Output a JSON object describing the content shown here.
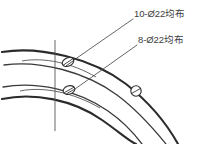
{
  "drawing": {
    "title": "Partial flange hole pattern detail",
    "background_color": "#ffffff",
    "line_color": "#2b2b2b",
    "centerline_color": "#555555",
    "leader_color": "#4a4a4a",
    "annotations": [
      {
        "id": "holes-10",
        "text": "10-Ø22均布",
        "quantity": 10,
        "diameter": 22,
        "distribution": "均布",
        "leader_from": [
          134,
          18
        ],
        "leader_to": [
          70,
          62
        ]
      },
      {
        "id": "holes-8",
        "text": "8-Ø22均布",
        "quantity": 8,
        "diameter": 22,
        "distribution": "均布",
        "leader_from": [
          138,
          44
        ],
        "leader_to": [
          70,
          90
        ]
      }
    ],
    "holes": [
      {
        "id": "hole-upper",
        "cx": 68,
        "cy": 62,
        "rx": 6.0,
        "ry": 4.2,
        "rotation": -24
      },
      {
        "id": "hole-lower-left",
        "cx": 69,
        "cy": 90,
        "rx": 6.0,
        "ry": 4.2,
        "rotation": -18
      },
      {
        "id": "hole-lower-right",
        "cx": 136,
        "cy": 91,
        "rx": 5.2,
        "ry": 5.2,
        "rotation": 0
      }
    ],
    "arcs": [
      {
        "id": "arc-outer-top",
        "weight": "heavy"
      },
      {
        "id": "arc-inner-top",
        "weight": "light"
      },
      {
        "id": "arc-outer-bottom",
        "weight": "heavy"
      },
      {
        "id": "arc-inner-bottom",
        "weight": "light"
      }
    ],
    "centerlines": [
      {
        "id": "centerline-vertical",
        "orientation": "vertical"
      },
      {
        "id": "centerline-arc-upper",
        "orientation": "arc"
      },
      {
        "id": "centerline-arc-lower",
        "orientation": "arc"
      }
    ]
  }
}
